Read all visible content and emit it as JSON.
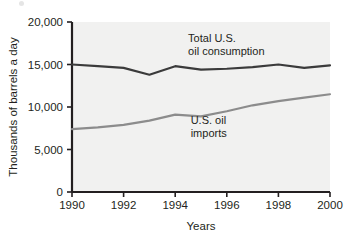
{
  "chart_data": {
    "type": "line",
    "title": "",
    "subtitle": "",
    "xlabel": "Years",
    "ylabel": "Thousands of barrels a day",
    "xlim": [
      1990,
      2000
    ],
    "ylim": [
      0,
      20000
    ],
    "grid": false,
    "legend_position": "inline-annotations",
    "x": [
      1990,
      1991,
      1992,
      1993,
      1994,
      1995,
      1996,
      1997,
      1998,
      1999,
      2000
    ],
    "xticks": [
      1990,
      1992,
      1994,
      1996,
      1998,
      2000
    ],
    "xticklabels": [
      "1990",
      "1992",
      "1994",
      "1996",
      "1998",
      "2000"
    ],
    "yticks": [
      0,
      5000,
      10000,
      15000,
      20000
    ],
    "yticklabels": [
      "0",
      "5,000",
      "10,000",
      "15,000",
      "20,000"
    ],
    "series": [
      {
        "name": "Total U.S. oil consumption",
        "color": "#3b3b3b",
        "width": 2.2,
        "values": [
          15000,
          14800,
          14600,
          13800,
          14800,
          14400,
          14500,
          14700,
          15000,
          14600,
          14900
        ]
      },
      {
        "name": "U.S. oil imports",
        "color": "#8c8c8c",
        "width": 2.2,
        "values": [
          7400,
          7600,
          7900,
          8400,
          9100,
          8900,
          9500,
          10200,
          10700,
          11100,
          11500
        ]
      }
    ],
    "annotations": [
      {
        "id": "consumption-label",
        "lines": [
          "Total U.S.",
          "oil consumption"
        ],
        "x": 1994.5,
        "y": 17600
      },
      {
        "id": "imports-label",
        "lines": [
          "U.S. oil",
          "imports"
        ],
        "x": 1994.6,
        "y": 8000
      }
    ],
    "style": {
      "plot_background": "#f1f1f0",
      "axis_color": "#231f20",
      "page_background": "#ffffff"
    }
  }
}
